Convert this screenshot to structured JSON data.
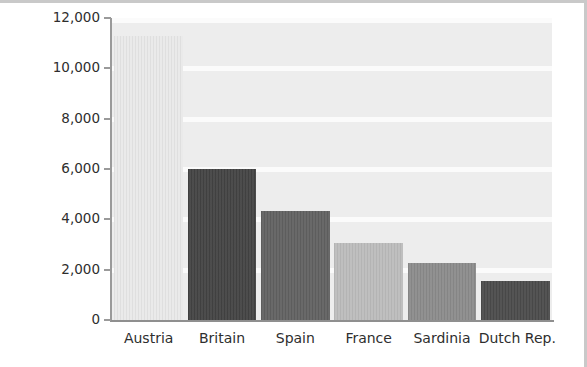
{
  "chart_data": {
    "type": "bar",
    "title": "",
    "xlabel": "",
    "ylabel": "CASUALTIES",
    "categories": [
      "Austria",
      "Britain",
      "Spain",
      "France",
      "Sardinia",
      "Dutch Rep."
    ],
    "values": [
      11300,
      6000,
      4350,
      3050,
      2250,
      1550
    ],
    "bar_colors": [
      "#e9e9e9",
      "#434343",
      "#616161",
      "#bcbcbc",
      "#8b8b8b",
      "#4b4b4b"
    ],
    "ylim": [
      0,
      12000
    ],
    "yticks": [
      0,
      2000,
      4000,
      6000,
      8000,
      10000,
      12000
    ],
    "ytick_labels": [
      "0",
      "2,000",
      "4,000",
      "6,000",
      "8,000",
      "10,000",
      "12,000"
    ],
    "grid": true,
    "grid_style": "horizontal-banded",
    "legend": "none",
    "plot_background": "#ededed",
    "figure_background": "#ffffff"
  }
}
